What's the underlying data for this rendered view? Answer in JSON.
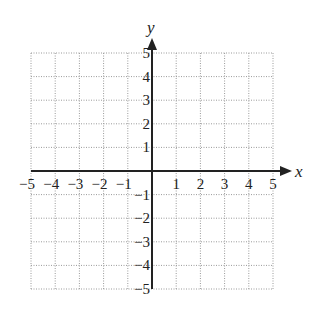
{
  "chart_data": {
    "type": "scatter",
    "title": "",
    "xlabel": "x",
    "ylabel": "y",
    "xlim": [
      -5,
      5
    ],
    "ylim": [
      -5,
      5
    ],
    "grid": true,
    "grid_style": "dotted",
    "x_ticks": [
      -5,
      -4,
      -3,
      -2,
      -1,
      1,
      2,
      3,
      4,
      5
    ],
    "y_ticks": [
      -5,
      -4,
      -3,
      -2,
      -1,
      1,
      2,
      3,
      4,
      5
    ],
    "x_tick_labels": [
      "−5",
      "−4",
      "−3",
      "−2",
      "−1",
      "1",
      "2",
      "3",
      "4",
      "5"
    ],
    "y_tick_labels": [
      "−5",
      "−4",
      "−3",
      "−2",
      "−1",
      "1",
      "2",
      "3",
      "4",
      "5"
    ],
    "series": [],
    "colors": {
      "axis": "#222222",
      "grid": "#9a9a9a",
      "background": "#ffffff"
    }
  }
}
